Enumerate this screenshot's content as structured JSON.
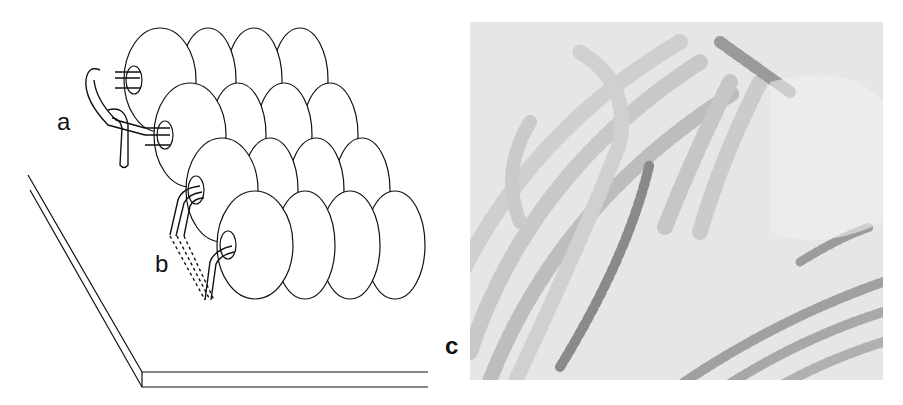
{
  "figure": {
    "panels": [
      {
        "id": "a",
        "label": "a",
        "type": "line-illustration",
        "subject": "couched beads stitch loop"
      },
      {
        "id": "b",
        "label": "b",
        "type": "line-illustration",
        "subject": "stitch through bead rows (dashed)"
      },
      {
        "id": "c",
        "label": "c",
        "type": "photograph",
        "subject": "beadwork spirals on fabric"
      }
    ]
  },
  "labels": {
    "a": "a",
    "b": "b",
    "c": "c"
  },
  "colors": {
    "line": "#111111",
    "background": "#ffffff",
    "photo_base": "#d8d8d8"
  }
}
